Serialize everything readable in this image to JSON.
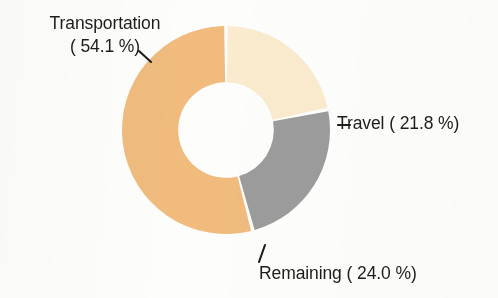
{
  "chart_data": {
    "type": "pie",
    "variant": "donut",
    "title": "",
    "subtitle": "",
    "xlabel": "",
    "ylabel": "",
    "legend_position": "none",
    "grid": false,
    "labels_outside": true,
    "hole_ratio": 0.46,
    "start_angle_deg": 0,
    "direction": "clockwise",
    "units": "percent",
    "categories": [
      "Transportation",
      "Travel",
      "Remaining"
    ],
    "values": [
      54.1,
      21.8,
      24.0
    ],
    "slices": [
      {
        "name": "Transportation",
        "value": 54.1,
        "value_text": "54.1 %",
        "label_text": "Transportation",
        "label_value_text": "( 54.1 %)",
        "color": "#f0bb7d",
        "leader_line": true
      },
      {
        "name": "Travel",
        "value": 21.8,
        "value_text": "21.8 %",
        "label_text": "Travel",
        "label_value_text": "( 21.8 %)",
        "label_full_text": "– Travel ( 21.8 %)",
        "color": "#faebce",
        "leader_line": true
      },
      {
        "name": "Remaining",
        "value": 24.0,
        "value_text": "24.0 %",
        "label_text": "Remaining",
        "label_value_text": "( 24.0 %)",
        "label_full_text": "Remaining ( 24.0 %)",
        "color": "#9c9c9c",
        "leader_line": true
      }
    ],
    "colors": {
      "transportation": "#f0bb7d",
      "travel": "#faebce",
      "remaining": "#9c9c9c",
      "background": "#fdfdfb",
      "separator": "#ffffff",
      "label_text": "#1d1d1d",
      "leader_line": "#1d1d1d"
    }
  }
}
